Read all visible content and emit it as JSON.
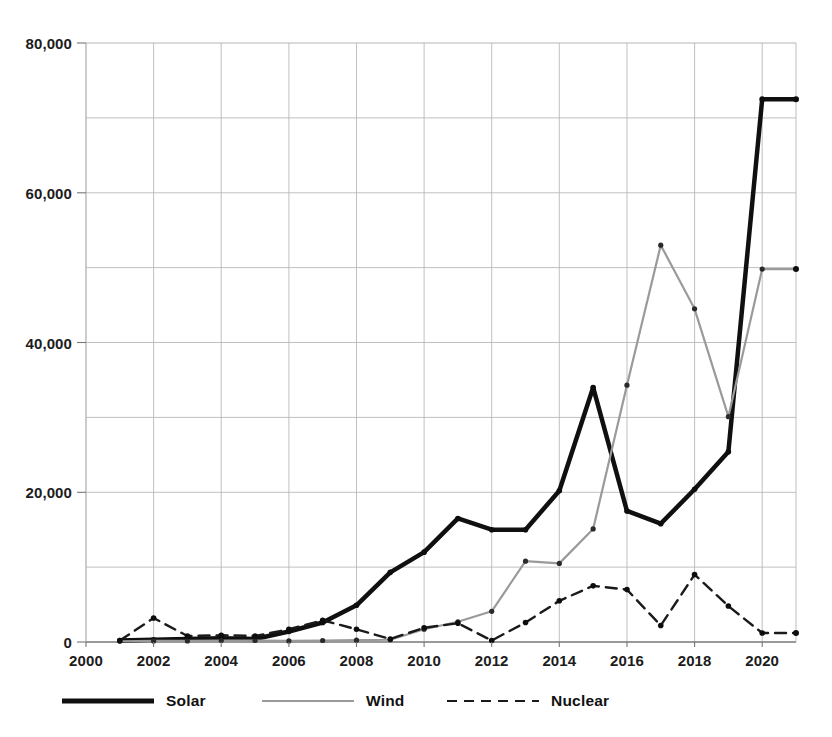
{
  "chart_data": {
    "type": "line",
    "title": "",
    "xlabel": "",
    "ylabel": "",
    "xlim": [
      2000,
      2021
    ],
    "ylim": [
      0,
      80000
    ],
    "grid": true,
    "legend_position": "bottom",
    "x_ticks": [
      2000,
      2002,
      2004,
      2006,
      2008,
      2010,
      2012,
      2014,
      2016,
      2018,
      2020
    ],
    "x_tick_labels": [
      "2000",
      "2002",
      "2004",
      "2006",
      "2008",
      "2010",
      "2012",
      "2014",
      "2016",
      "2018",
      "2020"
    ],
    "y_ticks": [
      0,
      20000,
      40000,
      60000,
      80000
    ],
    "y_tick_labels": [
      "0",
      "20,000",
      "40,000",
      "60,000",
      "80,000"
    ],
    "y_minor_ticks": [
      10000,
      30000,
      50000,
      70000
    ],
    "x": [
      2001,
      2002,
      2003,
      2004,
      2005,
      2006,
      2007,
      2008,
      2009,
      2010,
      2011,
      2012,
      2013,
      2014,
      2015,
      2016,
      2017,
      2018,
      2019,
      2020,
      2021
    ],
    "series": [
      {
        "name": "Solar",
        "color": "#101010",
        "style": "solid",
        "width": 4.5,
        "values": [
          200,
          300,
          400,
          500,
          400,
          1400,
          2600,
          4900,
          9300,
          12000,
          16500,
          15000,
          15000,
          20200,
          34000,
          17500,
          15800,
          20400,
          25400,
          72500,
          72500
        ]
      },
      {
        "name": "Wind",
        "color": "#9a9a9a",
        "style": "solid",
        "width": 2.2,
        "values": [
          100,
          150,
          150,
          200,
          200,
          150,
          200,
          250,
          300,
          1700,
          2700,
          4100,
          10800,
          10500,
          15100,
          34300,
          53000,
          44500,
          30100,
          49800,
          49800
        ]
      },
      {
        "name": "Nuclear",
        "color": "#1a1a1a",
        "style": "dashed",
        "width": 2.4,
        "values": [
          200,
          3200,
          800,
          900,
          800,
          1700,
          2900,
          1700,
          400,
          1900,
          2500,
          200,
          2600,
          5500,
          7500,
          7000,
          2200,
          9000,
          4800,
          1200,
          1200
        ]
      }
    ]
  },
  "axes": {
    "y_labels": [
      "80,000",
      "60,000",
      "40,000",
      "20,000",
      "0"
    ],
    "x_labels": [
      "2000",
      "2002",
      "2004",
      "2006",
      "2008",
      "2010",
      "2012",
      "2014",
      "2016",
      "2018",
      "2020"
    ]
  },
  "legend": {
    "items": [
      {
        "label": "Solar",
        "color": "#101010",
        "style": "solid",
        "thickness": "5px"
      },
      {
        "label": "Wind",
        "color": "#9a9a9a",
        "style": "solid",
        "thickness": "2px"
      },
      {
        "label": "Nuclear",
        "color": "#1a1a1a",
        "style": "dashed",
        "thickness": "2px"
      }
    ]
  }
}
